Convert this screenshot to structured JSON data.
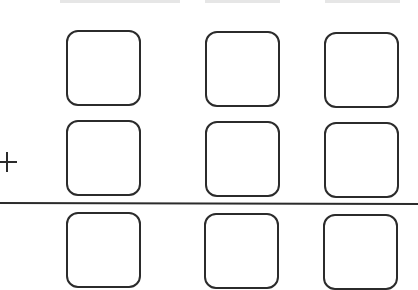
{
  "worksheet": {
    "operator": "+",
    "rows": [
      {
        "label": "addend-1",
        "boxes": [
          "",
          "",
          ""
        ]
      },
      {
        "label": "addend-2",
        "boxes": [
          "",
          "",
          ""
        ]
      },
      {
        "label": "sum",
        "boxes": [
          "",
          "",
          ""
        ]
      }
    ],
    "colors": {
      "stroke": "#2b2b2b",
      "background": "#ffffff"
    }
  }
}
